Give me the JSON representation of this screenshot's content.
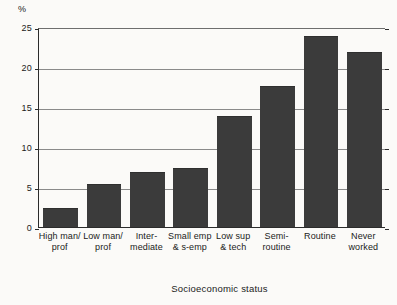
{
  "chart_data": {
    "type": "bar",
    "title": "",
    "subtitle": "",
    "xlabel": "Socioeconomic status",
    "ylabel": "%",
    "ylim": [
      0,
      25
    ],
    "ytick_values": [
      0,
      5,
      10,
      15,
      20,
      25
    ],
    "ytick_labels": [
      "0",
      "5",
      "10",
      "15",
      "20",
      "25"
    ],
    "grid": true,
    "gridlines_at": [
      5,
      10,
      15,
      20
    ],
    "legend": "none",
    "categories": [
      "High man/ prof",
      "Low man/ prof",
      "Inter- mediate",
      "Small emp & s-emp",
      "Low sup & tech",
      "Semi- routine",
      "Routine",
      "Never worked"
    ],
    "category_lines": [
      [
        "High man/",
        "prof"
      ],
      [
        "Low man/",
        "prof"
      ],
      [
        "Inter-",
        "mediate"
      ],
      [
        "Small emp",
        "& s-emp"
      ],
      [
        "Low sup",
        "& tech"
      ],
      [
        "Semi-",
        "routine"
      ],
      [
        "Routine",
        ""
      ],
      [
        "Never",
        "worked"
      ]
    ],
    "values": [
      2.2,
      5.2,
      6.8,
      7.3,
      13.7,
      17.5,
      23.8,
      21.8
    ],
    "bar_color": "#3b3b3b",
    "background_color": "#fbfaf8",
    "axis_color": "#2b2b2b",
    "gridline_color": "#8a8a8a"
  }
}
